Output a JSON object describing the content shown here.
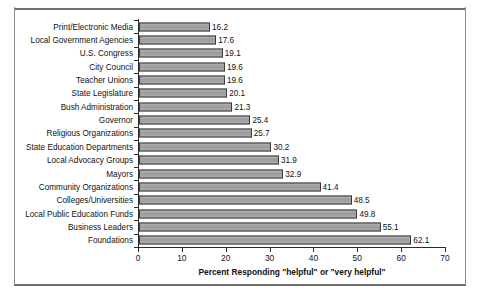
{
  "chart_data": {
    "type": "bar",
    "orientation": "horizontal",
    "title": "",
    "xlabel": "Percent Responding \"helpful\" or \"very helpful\"",
    "ylabel": "",
    "xlim": [
      0,
      70
    ],
    "xticks": [
      0,
      10,
      20,
      30,
      40,
      50,
      60,
      70
    ],
    "grid": false,
    "legend": false,
    "categories": [
      "Print/Electronic Media",
      "Local Government Agencies",
      "U.S. Congress",
      "City Council",
      "Teacher Unions",
      "State Legislature",
      "Bush Administration",
      "Governor",
      "Religious Organizations",
      "State Education Departments",
      "Local Advocacy Groups",
      "Mayors",
      "Community Organizations",
      "Colleges/Universities",
      "Local Public Education Funds",
      "Business Leaders",
      "Foundations"
    ],
    "values": [
      16.2,
      17.6,
      19.1,
      19.6,
      19.6,
      20.1,
      21.3,
      25.4,
      25.7,
      30.2,
      31.9,
      32.9,
      41.4,
      48.5,
      49.8,
      55.1,
      62.1
    ],
    "data_labels": [
      "16.2",
      "17.6",
      "19.1",
      "19.6",
      "19.6",
      "20.1",
      "21.3",
      "25.4",
      "25.7",
      "30.2",
      "31.9",
      "32.9",
      "41.4",
      "48.5",
      "49.8",
      "55.1",
      "62.1"
    ],
    "bar_color": "#a2a2a2",
    "bar_edge_color": "#3a3a3a",
    "background_color": "#ffffff",
    "axis_color": "#2a2a2a"
  }
}
